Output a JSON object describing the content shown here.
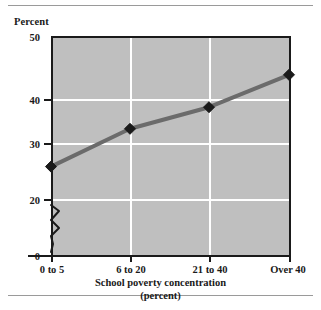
{
  "chart_data": {
    "type": "line",
    "title": "",
    "subtitle": "",
    "categories": [
      "0 to 5",
      "6 to 20",
      "21 to 40",
      "Over 40"
    ],
    "values": [
      26,
      33,
      37,
      43
    ],
    "series": [
      {
        "name": "Percent",
        "values": [
          26,
          33,
          37,
          43
        ]
      }
    ],
    "xlabel": "School poverty concentration",
    "xlabel_sub": "(percent)",
    "ylabel": "Percent",
    "ylim": [
      0,
      50
    ],
    "yticks": [
      0,
      20,
      30,
      40,
      50
    ],
    "ytick_labels": [
      "0",
      "20",
      "30",
      "40",
      "50"
    ],
    "y_axis_break": true,
    "y_axis_break_between": [
      0,
      20
    ],
    "grid": true,
    "grid_color": "#ffffff",
    "plot_background": "#bfbfbf",
    "line_color": "#6b6b6b",
    "marker_color": "#1a1a1a",
    "marker_shape": "diamond",
    "legend": false,
    "legend_position": "none"
  },
  "axes": {
    "y_title": "Percent",
    "y_ticks": [
      {
        "label": "50",
        "value": 50
      },
      {
        "label": "40",
        "value": 40
      },
      {
        "label": "30",
        "value": 30
      },
      {
        "label": "20",
        "value": 20
      },
      {
        "label": "0",
        "value": 0
      }
    ],
    "x_ticks": [
      {
        "label": "0 to 5"
      },
      {
        "label": "6 to 20"
      },
      {
        "label": "21 to 40"
      },
      {
        "label": "Over 40"
      }
    ],
    "x_title_line1": "School poverty concentration",
    "x_title_line2": "(percent)"
  },
  "colors": {
    "plot_background": "#bfbfbf",
    "gridline": "#ffffff",
    "axis": "#1a1a1a",
    "line": "#6b6b6b",
    "marker": "#1a1a1a",
    "rule": "#9a9a9a",
    "text": "#1a1a1a"
  }
}
